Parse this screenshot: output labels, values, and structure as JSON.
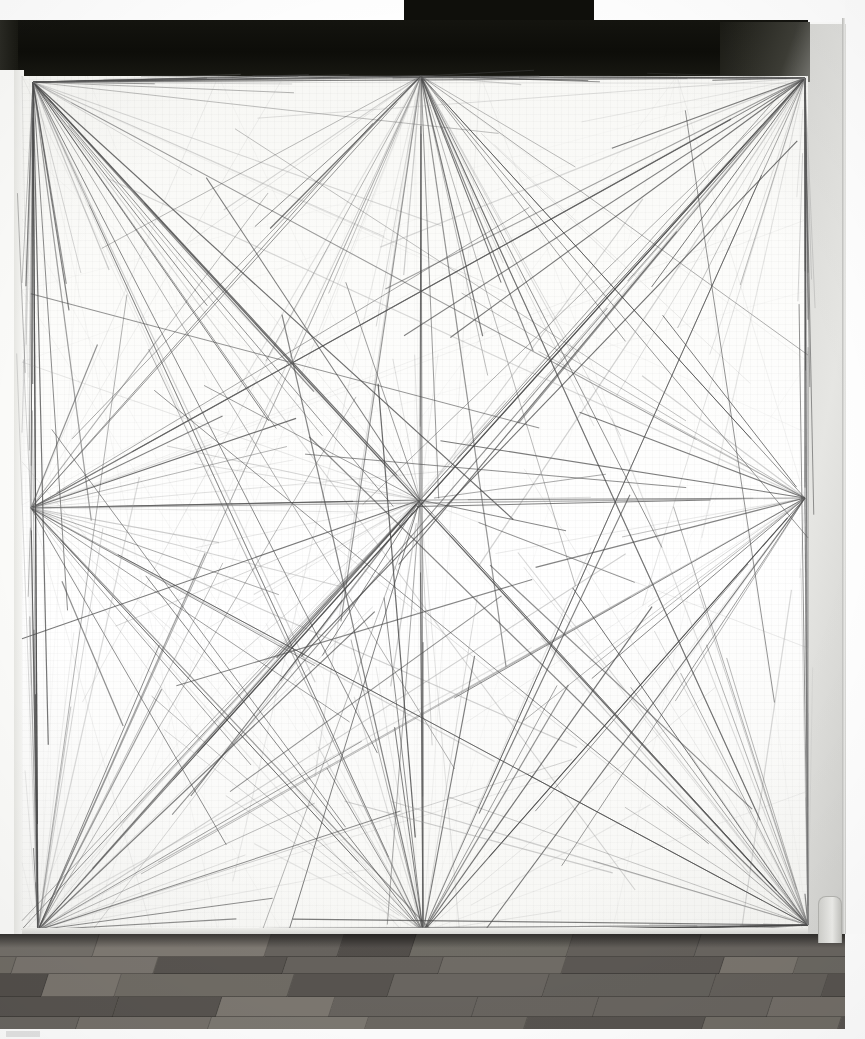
{
  "artwork": {
    "title": "Wall Drawing — Lines from points to points",
    "medium": "graphite pencil on wall",
    "caption": "",
    "description": "Photograph of a gallery wall drawing: straight graphite lines radiating from nine points (four corners, four edge midpoints, and the center of the wall)."
  },
  "scene": {
    "ceiling_soffit_label": "dark ceiling soffit band",
    "wall_label": "white drawing wall",
    "side_wall_label": "grey side wall return",
    "floor_label": "wood plank floor",
    "corner_object_label": "object at lower right corner"
  },
  "colors": {
    "wall": "#fcfcfa",
    "soffit": "#11110c",
    "side_wall": "#dcdcd9",
    "floor": "#575450",
    "line_dark": "#4a4a4a",
    "line_light": "#9a9a9a",
    "scan_background": "#ffffff"
  },
  "chart_data": {
    "type": "scatter",
    "xlabel": "",
    "ylabel": "",
    "xlim": [
      22,
      808
    ],
    "ylim": [
      76,
      934
    ],
    "grid": false,
    "legend": "none",
    "nodes": [
      {
        "name": "top-left",
        "x": 33,
        "y": 82,
        "fan_count": 34
      },
      {
        "name": "top-center",
        "x": 421,
        "y": 76,
        "fan_count": 32
      },
      {
        "name": "top-right",
        "x": 805,
        "y": 78,
        "fan_count": 34
      },
      {
        "name": "mid-left",
        "x": 31,
        "y": 508,
        "fan_count": 26
      },
      {
        "name": "center",
        "x": 420,
        "y": 500,
        "fan_count": 30
      },
      {
        "name": "mid-right",
        "x": 805,
        "y": 498,
        "fan_count": 26
      },
      {
        "name": "bottom-left",
        "x": 38,
        "y": 930,
        "fan_count": 34
      },
      {
        "name": "bottom-center",
        "x": 423,
        "y": 932,
        "fan_count": 32
      },
      {
        "name": "bottom-right",
        "x": 808,
        "y": 925,
        "fan_count": 34
      }
    ],
    "seed": 20240517,
    "segments_per_node_min": 24,
    "segments_per_node_max": 36,
    "line_width_range": [
      0.5,
      1.25
    ],
    "line_opacity_range": [
      0.18,
      0.85
    ],
    "length_fraction_range": [
      0.22,
      1.0
    ],
    "note": "Each node emits a fan of straight graphite segments aimed at the other nodes and at points along the wall edges; segment lengths are truncated at random fractions of the full chord."
  }
}
